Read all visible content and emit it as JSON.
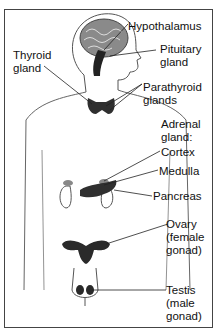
{
  "diagram": {
    "labels": {
      "hypothalamus": "Hypothalamus",
      "pituitary_1": "Pituitary",
      "pituitary_2": "gland",
      "thyroid_1": "Thyroid",
      "thyroid_2": "gland",
      "parathyroid_1": "Parathyroid",
      "parathyroid_2": "glands",
      "adrenal_1": "Adrenal",
      "adrenal_2": "gland:",
      "cortex": "Cortex",
      "medulla": "Medulla",
      "pancreas": "Pancreas",
      "ovary_1": "Ovary",
      "ovary_2": "(female",
      "ovary_3": "gonad)",
      "testis_1": "Testis",
      "testis_2": "(male",
      "testis_3": "gonad)"
    },
    "colors": {
      "outline": "#555555",
      "gland_fill": "#333333",
      "brain_fill": "#8a8a8a",
      "background": "#ffffff"
    }
  }
}
